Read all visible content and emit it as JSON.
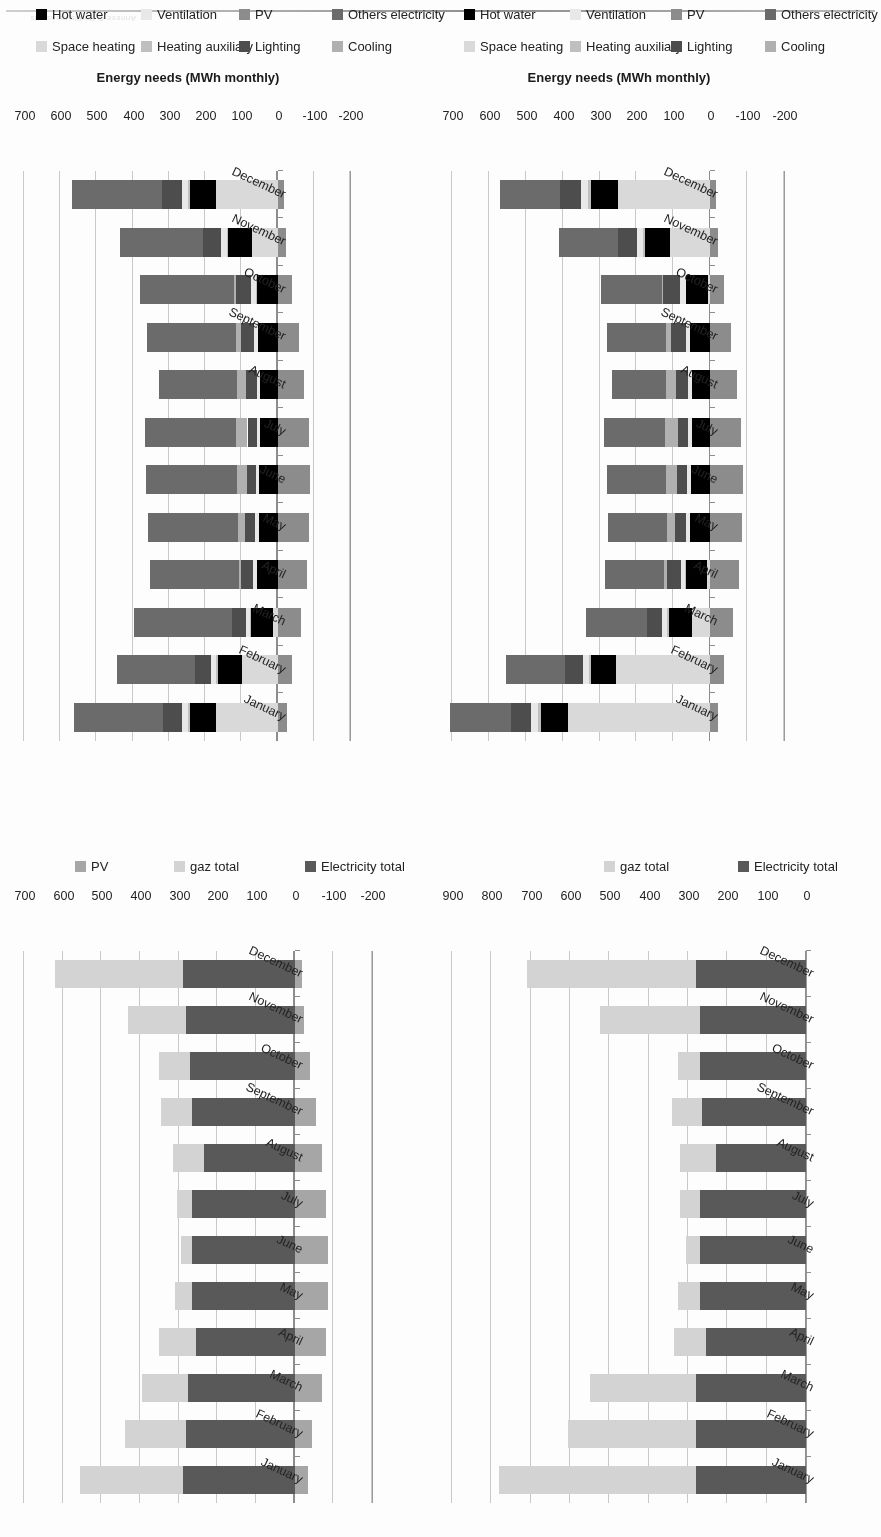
{
  "page": {
    "header_text": "Annexe C Profils mensuels",
    "orientation_note": "rotated-180"
  },
  "charts": [
    {
      "id": "chart-top-left",
      "position": "top-left",
      "chart_data": {
        "type": "bar",
        "orientation": "horizontal",
        "stacked": true,
        "title": "",
        "xlabel": "",
        "ylabel": "",
        "categories": [
          "January",
          "February",
          "March",
          "April",
          "May",
          "June",
          "July",
          "August",
          "September",
          "October",
          "November",
          "December"
        ],
        "axis_ticks": [
          0,
          100,
          200,
          300,
          400,
          500,
          600,
          700,
          800,
          900
        ],
        "xlim": [
          0,
          900
        ],
        "grid": true,
        "legend_position": "bottom",
        "series": [
          {
            "name": "Electricity total",
            "color": "#595959",
            "values": [
              280,
              280,
              280,
              255,
              270,
              270,
              270,
              230,
              265,
              270,
              270,
              280
            ]
          },
          {
            "name": "gaz total",
            "color": "#d3d3d3",
            "values": [
              500,
              325,
              270,
              80,
              55,
              35,
              50,
              90,
              75,
              55,
              255,
              430
            ]
          }
        ],
        "legend": [
          "Electricity total",
          "gaz total"
        ]
      }
    },
    {
      "id": "chart-top-right",
      "position": "top-right",
      "chart_data": {
        "type": "bar",
        "orientation": "horizontal",
        "stacked": true,
        "title": "",
        "xlabel": "",
        "ylabel": "",
        "categories": [
          "January",
          "February",
          "March",
          "April",
          "May",
          "June",
          "July",
          "August",
          "September",
          "October",
          "November",
          "December"
        ],
        "axis_ticks": [
          -200,
          -100,
          0,
          100,
          200,
          300,
          400,
          500,
          600,
          700
        ],
        "xlim": [
          -200,
          700
        ],
        "grid": true,
        "legend_position": "bottom",
        "series": [
          {
            "name": "Electricity total",
            "color": "#595959",
            "values": [
              290,
              280,
              275,
              255,
              265,
              265,
              265,
              235,
              265,
              270,
              280,
              290
            ]
          },
          {
            "name": "gaz total",
            "color": "#d3d3d3",
            "values": [
              265,
              160,
              120,
              95,
              45,
              30,
              40,
              80,
              80,
              80,
              150,
              330
            ]
          },
          {
            "name": "PV",
            "color": "#a6a6a6",
            "values": [
              -35,
              -45,
              -70,
              -80,
              -85,
              -85,
              -80,
              -70,
              -55,
              -40,
              -25,
              -20
            ]
          }
        ],
        "legend": [
          "Electricity total",
          "gaz total",
          "PV"
        ]
      }
    },
    {
      "id": "chart-bottom-left",
      "position": "bottom-left",
      "chart_data": {
        "type": "bar",
        "orientation": "horizontal",
        "stacked": true,
        "title": "",
        "xlabel": "",
        "ylabel": "Energy needs (MWh monthly)",
        "categories": [
          "January",
          "February",
          "March",
          "April",
          "May",
          "June",
          "July",
          "August",
          "September",
          "October",
          "November",
          "December"
        ],
        "axis_ticks": [
          -200,
          -100,
          0,
          100,
          200,
          300,
          400,
          500,
          600,
          700
        ],
        "xlim": [
          -200,
          700
        ],
        "grid": true,
        "legend_position": "bottom",
        "series": [
          {
            "name": "Space heating",
            "color": "#d9d9d9",
            "values": [
              385,
              255,
              50,
              8,
              0,
              0,
              0,
              0,
              0,
              5,
              110,
              250
            ]
          },
          {
            "name": "Hot water",
            "color": "#000000",
            "values": [
              75,
              68,
              62,
              58,
              55,
              52,
              50,
              50,
              55,
              60,
              68,
              74
            ]
          },
          {
            "name": "Heating auxiliary",
            "color": "#bfbfbf",
            "values": [
              8,
              6,
              4,
              2,
              0,
              0,
              0,
              0,
              0,
              2,
              5,
              8
            ]
          },
          {
            "name": "Ventilation",
            "color": "#e8e8e8",
            "values": [
              18,
              16,
              14,
              12,
              10,
              10,
              10,
              10,
              12,
              14,
              16,
              18
            ]
          },
          {
            "name": "Lighting",
            "color": "#4d4d4d",
            "values": [
              55,
              48,
              42,
              36,
              30,
              28,
              28,
              32,
              38,
              46,
              52,
              56
            ]
          },
          {
            "name": "Cooling",
            "color": "#b0b0b0",
            "values": [
              0,
              0,
              0,
              8,
              22,
              30,
              34,
              28,
              16,
              4,
              0,
              0
            ]
          },
          {
            "name": "Others electricity",
            "color": "#6b6b6b",
            "values": [
              165,
              160,
              165,
              160,
              160,
              160,
              165,
              145,
              160,
              165,
              160,
              165
            ]
          },
          {
            "name": "PV",
            "color": "#8c8c8c",
            "values": [
              -22,
              -38,
              -62,
              -78,
              -85,
              -88,
              -84,
              -72,
              -55,
              -38,
              -22,
              -16
            ]
          }
        ],
        "legend": [
          "Space heating",
          "Heating auxiliary",
          "Lighting",
          "Cooling",
          "Hot water",
          "Ventilation",
          "PV",
          "Others electricity"
        ]
      }
    },
    {
      "id": "chart-bottom-right",
      "position": "bottom-right",
      "chart_data": {
        "type": "bar",
        "orientation": "horizontal",
        "stacked": true,
        "title": "",
        "xlabel": "",
        "ylabel": "Energy needs (MWh monthly)",
        "categories": [
          "January",
          "February",
          "March",
          "April",
          "May",
          "June",
          "July",
          "August",
          "September",
          "October",
          "November",
          "December"
        ],
        "axis_ticks": [
          -200,
          -100,
          0,
          100,
          200,
          300,
          400,
          500,
          600,
          700
        ],
        "xlim": [
          -200,
          700
        ],
        "grid": true,
        "legend_position": "bottom",
        "series": [
          {
            "name": "Space heating",
            "color": "#d9d9d9",
            "values": [
              170,
              98,
              12,
              0,
              0,
              0,
              0,
              0,
              0,
              0,
              70,
              170
            ]
          },
          {
            "name": "Hot water",
            "color": "#000000",
            "values": [
              72,
              66,
              60,
              56,
              52,
              50,
              48,
              48,
              54,
              58,
              66,
              72
            ]
          },
          {
            "name": "Heating auxiliary",
            "color": "#bfbfbf",
            "values": [
              6,
              5,
              3,
              1,
              0,
              0,
              0,
              0,
              0,
              1,
              4,
              6
            ]
          },
          {
            "name": "Ventilation",
            "color": "#e8e8e8",
            "values": [
              16,
              14,
              12,
              10,
              9,
              9,
              9,
              9,
              11,
              13,
              15,
              16
            ]
          },
          {
            "name": "Lighting",
            "color": "#4d4d4d",
            "values": [
              52,
              45,
              40,
              34,
              28,
              26,
              26,
              30,
              36,
              44,
              50,
              54
            ]
          },
          {
            "name": "Cooling",
            "color": "#b0b0b0",
            "values": [
              0,
              0,
              0,
              6,
              20,
              28,
              32,
              26,
              14,
              3,
              0,
              0
            ]
          },
          {
            "name": "Others electricity",
            "color": "#6b6b6b",
            "values": [
              245,
              215,
              270,
              245,
              250,
              250,
              250,
              215,
              245,
              260,
              230,
              250
            ]
          },
          {
            "name": "PV",
            "color": "#8c8c8c",
            "values": [
              -25,
              -40,
              -65,
              -80,
              -88,
              -90,
              -86,
              -74,
              -58,
              -40,
              -24,
              -18
            ]
          }
        ],
        "legend": [
          "Space heating",
          "Heating auxiliary",
          "Lighting",
          "Cooling",
          "Hot water",
          "Ventilation",
          "PV",
          "Others electricity"
        ]
      }
    }
  ],
  "legend_colors": {
    "space_heating": "#d9d9d9",
    "hot_water": "#000000",
    "heating_auxiliary": "#bfbfbf",
    "ventilation": "#e8e8e8",
    "lighting": "#4d4d4d",
    "cooling": "#b0b0b0",
    "pv": "#8c8c8c",
    "others_electricity": "#6b6b6b",
    "electricity_total": "#595959",
    "gaz_total": "#d3d3d3"
  }
}
